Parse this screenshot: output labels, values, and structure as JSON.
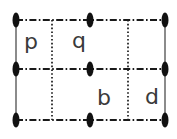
{
  "figure": {
    "width": 177,
    "height": 139,
    "background_color": "#ffffff",
    "line_color": "#1a1a1a",
    "border_color": "#6e6e6e",
    "marker_color": "#111111",
    "letter_color": "#3a3a3a"
  },
  "grid": {
    "left": 16,
    "right": 165,
    "top": 20,
    "middle": 69,
    "bottom": 120,
    "columns": [
      16,
      52,
      128,
      165
    ],
    "column_dividers": [
      52,
      128
    ],
    "rows": [
      20,
      69,
      120
    ],
    "row_count": 2,
    "column_count": 3,
    "horizontal_style": "dash-dot",
    "vertical_divider_style": "dotted",
    "side_border_style": "solid"
  },
  "markers": {
    "shape": "vertical-ellipse",
    "width": 7,
    "height": 15,
    "points": [
      {
        "name": "marker-top-left",
        "x": 16,
        "y": 20
      },
      {
        "name": "marker-top-center",
        "x": 90,
        "y": 20
      },
      {
        "name": "marker-top-right",
        "x": 165,
        "y": 20
      },
      {
        "name": "marker-middle-left",
        "x": 16,
        "y": 69
      },
      {
        "name": "marker-middle-center",
        "x": 90,
        "y": 69
      },
      {
        "name": "marker-middle-right",
        "x": 165,
        "y": 69
      },
      {
        "name": "marker-bottom-left",
        "x": 16,
        "y": 120
      },
      {
        "name": "marker-bottom-center",
        "x": 90,
        "y": 120
      },
      {
        "name": "marker-bottom-right",
        "x": 165,
        "y": 120
      }
    ]
  },
  "letters": [
    {
      "name": "letter-p",
      "text": "p",
      "x": 31,
      "y": 43,
      "row": 0,
      "column": 0
    },
    {
      "name": "letter-q",
      "text": "q",
      "x": 79,
      "y": 42,
      "row": 0,
      "column": 1
    },
    {
      "name": "letter-b",
      "text": "b",
      "x": 104,
      "y": 99,
      "row": 1,
      "column": 1
    },
    {
      "name": "letter-d",
      "text": "d",
      "x": 152,
      "y": 98,
      "row": 1,
      "column": 2
    }
  ]
}
